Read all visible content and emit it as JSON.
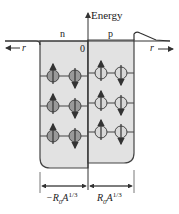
{
  "diagram": {
    "axis_label": "Energy",
    "origin_label": "0",
    "well_labels": {
      "neutron": "n",
      "proton": "p"
    },
    "radius_label_left": "r",
    "radius_label_right": "r",
    "dimension_left": {
      "prefix": "−R",
      "sub": "0",
      "mid": "A",
      "sup": "1/3"
    },
    "dimension_right": {
      "prefix": "R",
      "sub": "0",
      "mid": "A",
      "sup": "1/3"
    },
    "rows": 3,
    "neutron_spins": [
      [
        "up",
        "down"
      ],
      [
        "up",
        "down"
      ],
      [
        "up",
        "down"
      ]
    ],
    "proton_spins": [
      [
        "up",
        "down"
      ],
      [
        "up",
        "down"
      ],
      [
        "up",
        "down"
      ]
    ],
    "colors": {
      "well_fill": "#e2e2e2",
      "line": "#333333",
      "neutron_fill": "#9a9a9a",
      "proton_fill": "#d8d8d8"
    }
  }
}
